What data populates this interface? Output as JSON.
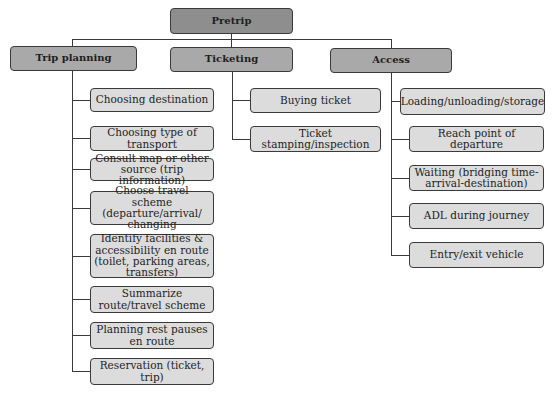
{
  "root": {
    "label": "Pretrip"
  },
  "categories": [
    {
      "label": "Trip planning",
      "items": [
        "Choosing destination",
        "Choosing type of transport",
        "Consult map or other source (trip information)",
        "Choose travel scheme (departure/arrival/ changing",
        "Identify facilities & accessibility en route (toilet, parking areas, transfers)",
        "Summarize route/travel scheme",
        "Planning rest pauses en route",
        "Reservation (ticket, trip)"
      ]
    },
    {
      "label": "Ticketing",
      "items": [
        "Buying ticket",
        "Ticket stamping/inspection"
      ]
    },
    {
      "label": "Access",
      "items": [
        "Loading/unloading/storage",
        "Reach point of departure",
        "Waiting (bridging time-arrival-destination)",
        "ADL during journey",
        "Entry/exit vehicle"
      ]
    }
  ],
  "colors": {
    "root_fill": "#8e8e8e",
    "category_fill": "#a9a9a9",
    "leaf_fill": "#dcdcdc",
    "line": "#3a3a3a"
  }
}
